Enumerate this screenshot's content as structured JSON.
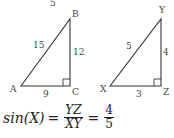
{
  "triangle_abc": {
    "vertices": {
      "A": "A",
      "B": "B",
      "C": "C"
    },
    "sides": {
      "AB": "15",
      "BC": "12",
      "AC": "9"
    },
    "top_label": "5",
    "right_angle_at": "C"
  },
  "triangle_xyz": {
    "vertices": {
      "X": "X",
      "Y": "Y",
      "Z": "Z"
    },
    "sides": {
      "XY": "5",
      "YZ": "4",
      "XZ": "3"
    },
    "right_angle_at": "Z"
  },
  "equation": {
    "lhs": "sin(X)",
    "equals": "=",
    "frac1_num": "YZ",
    "frac1_den": "XY",
    "frac2_num": "4",
    "frac2_den": "5"
  },
  "colors": {
    "stroke": "#333333",
    "text": "#444444"
  }
}
